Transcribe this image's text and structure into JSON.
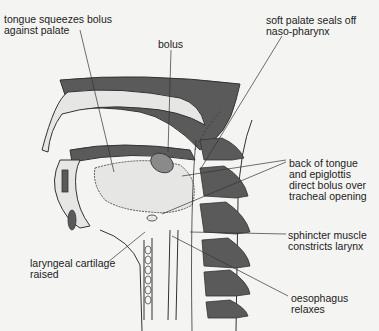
{
  "diagram": {
    "colors": {
      "background": "#f4f4f2",
      "dark_tissue": "#5a5a5a",
      "light_tissue": "#e6e6e4",
      "outline": "#333333",
      "bolus": "#8a8a8a"
    },
    "labels": [
      {
        "id": "tongue",
        "text": "tongue squeezes bolus\nagainst palate"
      },
      {
        "id": "bolus",
        "text": "bolus"
      },
      {
        "id": "soft-palate",
        "text": "soft palate seals off\nnaso-pharynx"
      },
      {
        "id": "back-of-tongue",
        "text": "back of tongue\nand epiglottis\ndirect bolus over\ntracheal opening"
      },
      {
        "id": "sphincter",
        "text": "sphincter muscle\nconstricts larynx"
      },
      {
        "id": "laryngeal",
        "text": "laryngeal cartilage\nraised"
      },
      {
        "id": "oesophagus",
        "text": "oesophagus\nrelaxes"
      }
    ]
  }
}
